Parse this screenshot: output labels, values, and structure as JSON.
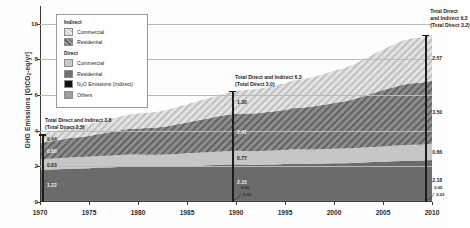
{
  "chart_data": {
    "type": "area",
    "title": "",
    "xlabel": "",
    "ylabel": "GHG Emissions [GtCO2-eq/yr]",
    "ylabel_prefix": "GHG Emissions [GtCO",
    "ylabel_sub": "2",
    "ylabel_suffix": "-eq/yr]",
    "xlim": [
      1970,
      2010
    ],
    "ylim": [
      0,
      11
    ],
    "yticks": [
      "0",
      "2",
      "4",
      "6",
      "8",
      "10"
    ],
    "ytick_values": [
      0,
      2,
      4,
      6,
      8,
      10
    ],
    "xticks": [
      "1970",
      "1975",
      "1980",
      "1985",
      "1990",
      "1995",
      "2000",
      "2005",
      "2010"
    ],
    "xtick_values": [
      1970,
      1975,
      1980,
      1985,
      1990,
      1995,
      2000,
      2005,
      2010
    ],
    "grid": "horizontal",
    "legend_position": "upper-left-inset",
    "stack_order_bottom_to_top": [
      "Direct Others",
      "Direct N2O Emissions (Indirect)",
      "Direct Residential",
      "Direct Commercial",
      "Indirect Residential",
      "Indirect Commercial"
    ],
    "x": [
      1970,
      1971,
      1972,
      1973,
      1974,
      1975,
      1976,
      1977,
      1978,
      1979,
      1980,
      1981,
      1982,
      1983,
      1984,
      1985,
      1986,
      1987,
      1988,
      1989,
      1990,
      1991,
      1992,
      1993,
      1994,
      1995,
      1996,
      1997,
      1998,
      1999,
      2000,
      2001,
      2002,
      2003,
      2004,
      2005,
      2006,
      2007,
      2008,
      2009,
      2010
    ],
    "series": [
      {
        "name": "Direct Others",
        "values": [
          0.05,
          0.05,
          0.05,
          0.05,
          0.05,
          0.05,
          0.05,
          0.05,
          0.05,
          0.05,
          0.05,
          0.05,
          0.05,
          0.05,
          0.05,
          0.05,
          0.05,
          0.05,
          0.05,
          0.05,
          0.05,
          0.05,
          0.05,
          0.05,
          0.05,
          0.05,
          0.05,
          0.05,
          0.05,
          0.05,
          0.05,
          0.05,
          0.05,
          0.05,
          0.05,
          0.05,
          0.05,
          0.05,
          0.05,
          0.05,
          0.05
        ]
      },
      {
        "name": "Direct N2O Emissions (Indirect)",
        "values": [
          0.03,
          0.03,
          0.03,
          0.03,
          0.03,
          0.03,
          0.03,
          0.03,
          0.03,
          0.03,
          0.03,
          0.03,
          0.03,
          0.03,
          0.03,
          0.03,
          0.03,
          0.03,
          0.03,
          0.03,
          0.03,
          0.03,
          0.03,
          0.03,
          0.03,
          0.03,
          0.03,
          0.03,
          0.03,
          0.03,
          0.03,
          0.03,
          0.03,
          0.03,
          0.03,
          0.03,
          0.03,
          0.03,
          0.03,
          0.03,
          0.03
        ]
      },
      {
        "name": "Direct Residential",
        "values": [
          1.72,
          1.74,
          1.76,
          1.79,
          1.8,
          1.82,
          1.85,
          1.86,
          1.88,
          1.9,
          1.9,
          1.89,
          1.89,
          1.9,
          1.92,
          1.94,
          1.96,
          1.98,
          2.0,
          2.02,
          2.03,
          2.02,
          2.01,
          2.02,
          2.03,
          2.05,
          2.08,
          2.07,
          2.07,
          2.08,
          2.09,
          2.1,
          2.11,
          2.14,
          2.16,
          2.18,
          2.2,
          2.22,
          2.24,
          2.25,
          2.28
        ]
      },
      {
        "name": "Direct Commercial",
        "values": [
          0.6,
          0.61,
          0.62,
          0.63,
          0.64,
          0.64,
          0.65,
          0.66,
          0.67,
          0.68,
          0.68,
          0.68,
          0.68,
          0.69,
          0.7,
          0.71,
          0.72,
          0.73,
          0.74,
          0.75,
          0.76,
          0.76,
          0.76,
          0.77,
          0.78,
          0.79,
          0.8,
          0.8,
          0.8,
          0.81,
          0.82,
          0.82,
          0.83,
          0.84,
          0.85,
          0.86,
          0.87,
          0.88,
          0.89,
          0.89,
          0.91
        ]
      },
      {
        "name": "Indirect Residential",
        "values": [
          0.91,
          0.96,
          1.02,
          1.09,
          1.12,
          1.17,
          1.24,
          1.3,
          1.37,
          1.43,
          1.47,
          1.5,
          1.53,
          1.58,
          1.66,
          1.73,
          1.81,
          1.88,
          1.96,
          2.03,
          2.08,
          2.1,
          2.12,
          2.16,
          2.2,
          2.25,
          2.33,
          2.36,
          2.42,
          2.49,
          2.57,
          2.64,
          2.74,
          2.88,
          3.02,
          3.16,
          3.28,
          3.4,
          3.46,
          3.48,
          3.54
        ]
      },
      {
        "name": "Indirect Commercial",
        "values": [
          0.49,
          0.52,
          0.56,
          0.6,
          0.62,
          0.65,
          0.69,
          0.73,
          0.77,
          0.81,
          0.84,
          0.86,
          0.88,
          0.92,
          0.97,
          1.02,
          1.07,
          1.12,
          1.17,
          1.22,
          1.3,
          1.33,
          1.36,
          1.4,
          1.45,
          1.5,
          1.56,
          1.6,
          1.66,
          1.73,
          1.8,
          1.87,
          1.95,
          2.06,
          2.17,
          2.28,
          2.38,
          2.47,
          2.52,
          2.54,
          2.57
        ]
      }
    ],
    "annotations": [
      {
        "id": "marker-1970",
        "year": 1970,
        "line1": "Total Direct and Indirect 3.8",
        "line2": "(Total Direct 2.5)",
        "total": 3.8,
        "direct_total": 2.5,
        "segment_labels": [
          "1.22",
          "0.83",
          "0.86",
          "0.44"
        ]
      },
      {
        "id": "marker-1990",
        "year": 1990,
        "line1": "Total Direct and Indirect 6.3",
        "line2": "(Total Direct 3.0)",
        "total": 6.3,
        "direct_total": 3.0,
        "segment_labels": [
          "2.15",
          "0.77",
          "2.41",
          "1.30"
        ],
        "small_labels": [
          "0.05",
          "0.03"
        ]
      },
      {
        "id": "marker-2010",
        "year": 2010,
        "line1": "Total Direct",
        "line2": "and Indirect 9.2",
        "line3": "(Total Direct 3.2)",
        "total": 9.2,
        "direct_total": 3.2,
        "right_labels": [
          "2.57",
          "3.50",
          "0.66",
          "2.18"
        ],
        "small_labels": [
          "0.05",
          "0.03"
        ]
      }
    ]
  },
  "legend": {
    "groups": [
      {
        "heading": "Indirect",
        "items": [
          {
            "label": "Commercial",
            "color": "#dcdcdc",
            "pattern": "hatch-light"
          },
          {
            "label": "Residential",
            "color": "#8f8f8f",
            "pattern": "hatch-dark"
          }
        ]
      },
      {
        "heading": "Direct",
        "items": [
          {
            "label": "Commercial",
            "color": "#c9c9c9",
            "pattern": "solid"
          },
          {
            "label": "Residential",
            "color": "#6f6f6f",
            "pattern": "solid"
          },
          {
            "label_prefix": "N",
            "label_sub": "2",
            "label_suffix": "O Emissions (Indirect)",
            "label": "N2O Emissions (Indirect)",
            "color": "#111111",
            "pattern": "solid"
          },
          {
            "label": "Others",
            "color": "#9d9d9d",
            "pattern": "solid"
          }
        ]
      }
    ]
  },
  "colors": {
    "indirect_commercial": "#d9d9d9",
    "indirect_residential": "#8d8d8d",
    "direct_commercial": "#c6c6c6",
    "direct_residential": "#6b6b6b",
    "direct_n2o": "#111111",
    "direct_others": "#9b9b9b",
    "axis": "#3a3a3a",
    "grid": "#b9b9b9",
    "text": "#1c1c1c",
    "background": "#fefefe"
  }
}
